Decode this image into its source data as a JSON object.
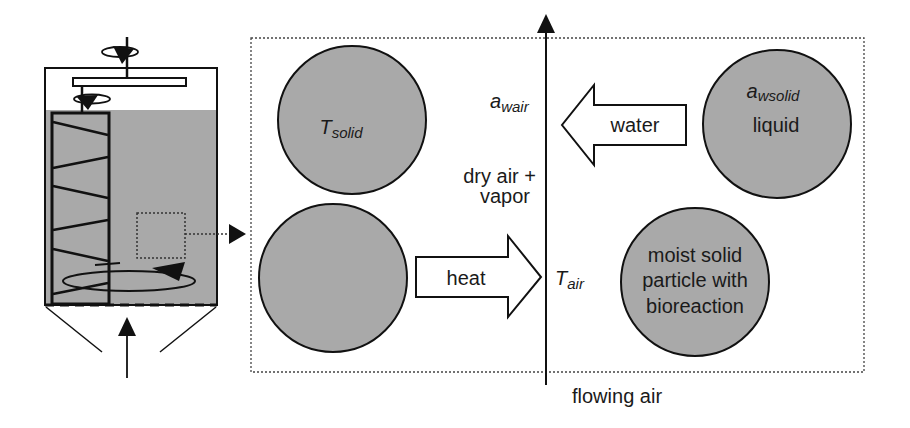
{
  "colors": {
    "fill_gray": "#a9a9a9",
    "stroke": "#111111",
    "background": "#ffffff"
  },
  "reactor": {
    "description": "stirred solid-state bioreactor with helical screw agitator, air inlet from bottom"
  },
  "zoom_box": {
    "labels": {
      "a_wair_main": "a",
      "a_wair_sub": "wair",
      "dry_air_line1": "dry air +",
      "dry_air_line2": "vapor",
      "t_air_main": "T",
      "t_air_sub": "air",
      "flowing_air": "flowing air"
    },
    "particles": [
      {
        "id": "top-left",
        "main": "T",
        "sub": "solid"
      },
      {
        "id": "bottom-left"
      },
      {
        "id": "top-right",
        "main": "a",
        "sub": "wsolid",
        "line2": "liquid"
      },
      {
        "id": "bottom-right",
        "lines": [
          "moist solid",
          "particle with",
          "bioreaction"
        ]
      }
    ],
    "arrows": {
      "water": "water",
      "heat": "heat"
    }
  }
}
